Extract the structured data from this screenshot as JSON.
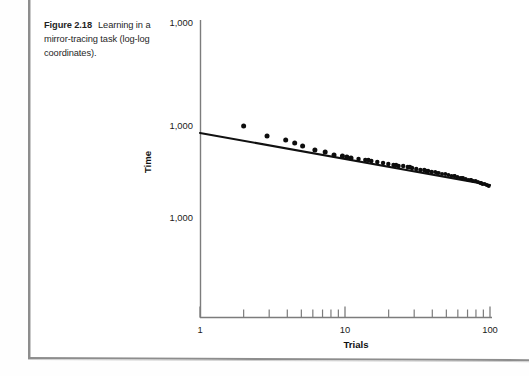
{
  "page": {
    "caption_figure_number": "Figure 2.18",
    "caption_text": "Learning in a mirror-tracing task (log-log coordinates)."
  },
  "chart_data": {
    "type": "scatter",
    "title": "",
    "xlabel": "Trials",
    "ylabel": "Time",
    "scale": "log-log",
    "grid": false,
    "legend": null,
    "xlim": [
      1,
      100
    ],
    "x_tick_labels": [
      "1",
      "10",
      "100"
    ],
    "x_tick_values": [
      1,
      10,
      100
    ],
    "x_minor_tick_values": [
      2,
      3,
      4,
      5,
      6,
      7,
      8,
      9,
      20,
      30,
      40,
      50,
      60,
      70,
      80,
      90
    ],
    "y_tick_labels": [
      "1,000",
      "1,000",
      "1,000"
    ],
    "y_tick_positions_px": [
      22,
      125,
      217
    ],
    "axis_note": "All three printed y-axis tick labels read 1,000 in the scanned original.",
    "trend_line": {
      "x_start": 1,
      "x_end": 100,
      "y_start_px": 133,
      "y_end_px": 185,
      "description": "Straight fitted power-law line descending left to right"
    },
    "points": [
      {
        "x": 2.0,
        "y_px": 126
      },
      {
        "x": 2.9,
        "y_px": 136
      },
      {
        "x": 3.9,
        "y_px": 140
      },
      {
        "x": 5.1,
        "y_px": 146
      },
      {
        "x": 6.2,
        "y_px": 150
      },
      {
        "x": 7.3,
        "y_px": 152
      },
      {
        "x": 8.4,
        "y_px": 155
      },
      {
        "x": 9.6,
        "y_px": 156
      },
      {
        "x": 11.0,
        "y_px": 158
      },
      {
        "x": 12.4,
        "y_px": 159
      },
      {
        "x": 13.8,
        "y_px": 160
      },
      {
        "x": 15.2,
        "y_px": 161
      },
      {
        "x": 16.7,
        "y_px": 162
      },
      {
        "x": 18.3,
        "y_px": 163
      },
      {
        "x": 19.9,
        "y_px": 164
      },
      {
        "x": 21.6,
        "y_px": 165
      },
      {
        "x": 23.4,
        "y_px": 166
      },
      {
        "x": 25.2,
        "y_px": 166
      },
      {
        "x": 27.1,
        "y_px": 167
      },
      {
        "x": 29.0,
        "y_px": 168
      },
      {
        "x": 31.0,
        "y_px": 169
      },
      {
        "x": 33.1,
        "y_px": 170
      },
      {
        "x": 35.2,
        "y_px": 170
      },
      {
        "x": 37.4,
        "y_px": 171
      },
      {
        "x": 39.6,
        "y_px": 172
      },
      {
        "x": 41.9,
        "y_px": 172
      },
      {
        "x": 44.3,
        "y_px": 173
      },
      {
        "x": 46.7,
        "y_px": 174
      },
      {
        "x": 49.2,
        "y_px": 174
      },
      {
        "x": 51.7,
        "y_px": 175
      },
      {
        "x": 54.3,
        "y_px": 176
      },
      {
        "x": 56.9,
        "y_px": 176
      },
      {
        "x": 59.6,
        "y_px": 177
      },
      {
        "x": 62.3,
        "y_px": 178
      },
      {
        "x": 65.1,
        "y_px": 178
      },
      {
        "x": 67.9,
        "y_px": 179
      },
      {
        "x": 70.8,
        "y_px": 180
      },
      {
        "x": 73.7,
        "y_px": 180
      },
      {
        "x": 76.6,
        "y_px": 181
      },
      {
        "x": 79.6,
        "y_px": 181
      },
      {
        "x": 82.6,
        "y_px": 182
      },
      {
        "x": 85.6,
        "y_px": 183
      },
      {
        "x": 88.7,
        "y_px": 184
      },
      {
        "x": 91.8,
        "y_px": 184
      },
      {
        "x": 94.9,
        "y_px": 185
      },
      {
        "x": 98.0,
        "y_px": 186
      }
    ],
    "scatter_extra_points": [
      {
        "x": 4.5,
        "y_px": 143
      },
      {
        "x": 10.3,
        "y_px": 157
      },
      {
        "x": 14.5,
        "y_px": 160
      },
      {
        "x": 22.5,
        "y_px": 165
      },
      {
        "x": 28.0,
        "y_px": 167
      },
      {
        "x": 36.3,
        "y_px": 171
      },
      {
        "x": 43.1,
        "y_px": 173
      },
      {
        "x": 57.0,
        "y_px": 176
      },
      {
        "x": 64.0,
        "y_px": 178
      },
      {
        "x": 74.0,
        "y_px": 180
      },
      {
        "x": 87.0,
        "y_px": 183
      }
    ]
  }
}
